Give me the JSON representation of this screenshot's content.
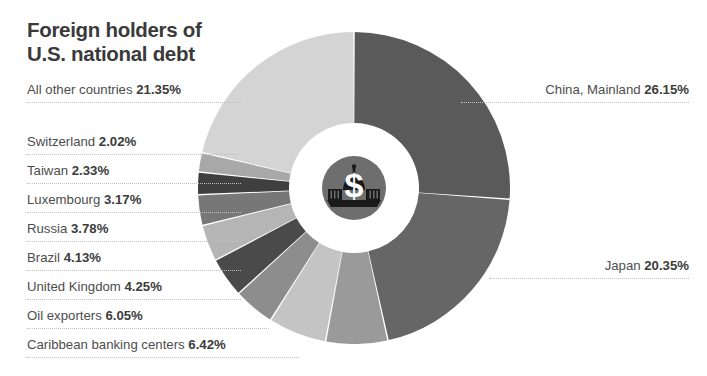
{
  "title": "Foreign holders of\nU.S. national debt",
  "icon": {
    "name": "capitol-dollar-icon",
    "symbol": "$",
    "circle_color": "#6e6e6e",
    "building_color": "#1a1a1a",
    "symbol_color": "#ffffff"
  },
  "labels": {
    "all_other_countries": {
      "name": "All other countries",
      "pct": "21.35%"
    },
    "switzerland": {
      "name": "Switzerland",
      "pct": "2.02%"
    },
    "taiwan": {
      "name": "Taiwan",
      "pct": "2.33%"
    },
    "luxembourg": {
      "name": "Luxembourg",
      "pct": "3.17%"
    },
    "russia": {
      "name": "Russia",
      "pct": "3.78%"
    },
    "brazil": {
      "name": "Brazil",
      "pct": "4.13%"
    },
    "united_kingdom": {
      "name": "United Kingdom",
      "pct": "4.25%"
    },
    "oil_exporters": {
      "name": "Oil exporters",
      "pct": "6.05%"
    },
    "caribbean": {
      "name": "Caribbean banking centers",
      "pct": "6.42%"
    },
    "china": {
      "name": "China, Mainland",
      "pct": "26.15%"
    },
    "japan": {
      "name": "Japan",
      "pct": "20.35%"
    }
  },
  "chart_data": {
    "type": "pie",
    "variant": "donut",
    "title": "Foreign holders of U.S. national debt",
    "unit": "percent",
    "value_suffix": "%",
    "start_angle_deg": 0,
    "direction": "clockwise",
    "outer_radius_px": 156,
    "inner_radius_px": 65,
    "slice_gap_deg": 0.55,
    "gap_color": "#ffffff",
    "total": 100.0,
    "legend": "labels-with-leader-lines",
    "grid": false,
    "categories": [
      "China, Mainland",
      "Japan",
      "Caribbean banking centers",
      "Oil exporters",
      "United Kingdom",
      "Brazil",
      "Russia",
      "Luxembourg",
      "Taiwan",
      "Switzerland",
      "All other countries"
    ],
    "values": [
      26.15,
      20.35,
      6.42,
      6.05,
      4.25,
      4.13,
      3.78,
      3.17,
      2.33,
      2.02,
      21.35
    ],
    "colors": [
      "#5a5a5a",
      "#666666",
      "#9a9a9a",
      "#c4c4c4",
      "#8d8d8d",
      "#4a4a4a",
      "#b5b5b5",
      "#777777",
      "#3f3f3f",
      "#a8a8a8",
      "#d4d4d4"
    ],
    "slices": [
      {
        "label": "China, Mainland",
        "value": 26.15,
        "color": "#5a5a5a"
      },
      {
        "label": "Japan",
        "value": 20.35,
        "color": "#666666"
      },
      {
        "label": "Caribbean banking centers",
        "value": 6.42,
        "color": "#9a9a9a"
      },
      {
        "label": "Oil exporters",
        "value": 6.05,
        "color": "#c4c4c4"
      },
      {
        "label": "United Kingdom",
        "value": 4.25,
        "color": "#8d8d8d"
      },
      {
        "label": "Brazil",
        "value": 4.13,
        "color": "#4a4a4a"
      },
      {
        "label": "Russia",
        "value": 3.78,
        "color": "#b5b5b5"
      },
      {
        "label": "Luxembourg",
        "value": 3.17,
        "color": "#777777"
      },
      {
        "label": "Taiwan",
        "value": 2.33,
        "color": "#3f3f3f"
      },
      {
        "label": "Switzerland",
        "value": 2.02,
        "color": "#a8a8a8"
      },
      {
        "label": "All other countries",
        "value": 21.35,
        "color": "#d4d4d4"
      }
    ]
  }
}
